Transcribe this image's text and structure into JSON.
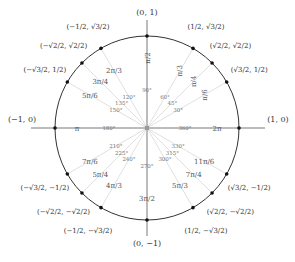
{
  "diagram": {
    "center": [
      147,
      128
    ],
    "radius": 92,
    "colors": {
      "circle": "#333333",
      "axis": "#555555",
      "spoke": "#d8d8d8",
      "point": "#111111",
      "text_coord": "#333333",
      "text_rad": "#555555",
      "text_deg": "#777777"
    },
    "axis_labels": [
      {
        "id": "top",
        "text": "(0, 1)",
        "x": 147,
        "y": 15
      },
      {
        "id": "bottom",
        "text": "(0, −1)",
        "x": 147,
        "y": 246
      },
      {
        "id": "left",
        "text": "(−1, 0)",
        "x": 22,
        "y": 122
      },
      {
        "id": "right",
        "text": "(1, 0)",
        "x": 278,
        "y": 122
      }
    ],
    "angles": [
      {
        "deg": 0,
        "deg_label": "360°",
        "rad_label": "2π",
        "coord": "(1, 0)",
        "axis": true
      },
      {
        "deg": 30,
        "deg_label": "30°",
        "rad_label": "π/6",
        "coord": "(√3/2, 1/2)"
      },
      {
        "deg": 45,
        "deg_label": "45°",
        "rad_label": "π/4",
        "coord": "(√2/2, √2/2)"
      },
      {
        "deg": 60,
        "deg_label": "60°",
        "rad_label": "π/3",
        "coord": "(1/2, √3/2)"
      },
      {
        "deg": 90,
        "deg_label": "90°",
        "rad_label": "π/2",
        "coord": "(0, 1)",
        "axis": true
      },
      {
        "deg": 120,
        "deg_label": "120°",
        "rad_label": "2π/3",
        "coord": "(−1/2, √3/2)"
      },
      {
        "deg": 135,
        "deg_label": "135°",
        "rad_label": "3π/4",
        "coord": "(−√2/2, √2/2)"
      },
      {
        "deg": 150,
        "deg_label": "150°",
        "rad_label": "5π/6",
        "coord": "(−√3/2, 1/2)"
      },
      {
        "deg": 180,
        "deg_label": "180°",
        "rad_label": "π",
        "coord": "(−1, 0)",
        "axis": true
      },
      {
        "deg": 210,
        "deg_label": "210°",
        "rad_label": "7π/6",
        "coord": "(−√3/2, −1/2)"
      },
      {
        "deg": 225,
        "deg_label": "225°",
        "rad_label": "5π/4",
        "coord": "(−√2/2, −√2/2)"
      },
      {
        "deg": 240,
        "deg_label": "240°",
        "rad_label": "4π/3",
        "coord": "(−1/2, −√3/2)"
      },
      {
        "deg": 270,
        "deg_label": "270°",
        "rad_label": "3π/2",
        "coord": "(0, −1)",
        "axis": true
      },
      {
        "deg": 300,
        "deg_label": "300°",
        "rad_label": "5π/3",
        "coord": "(1/2, −√3/2)"
      },
      {
        "deg": 315,
        "deg_label": "315°",
        "rad_label": "7π/4",
        "coord": "(√2/2, −√2/2)"
      },
      {
        "deg": 330,
        "deg_label": "330°",
        "rad_label": "11π/6",
        "coord": "(√3/2, −1/2)"
      }
    ]
  }
}
